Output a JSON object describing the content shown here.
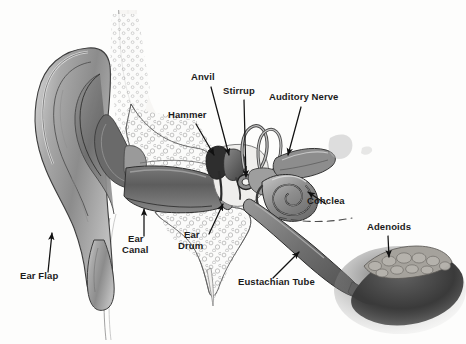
{
  "figure": {
    "background_color": "#fdfdfc",
    "label_color": "#1b1b1b",
    "ink_color": "#1a1a1a",
    "style": "grayscale medical illustration, cross-section"
  },
  "labels": {
    "ear_flap": "Ear Flap",
    "ear_canal_line1": "Ear",
    "ear_canal_line2": "Canal",
    "ear_drum_line1": "Ear",
    "ear_drum_line2": "Drum",
    "hammer": "Hammer",
    "anvil": "Anvil",
    "stirrup": "Stirrup",
    "auditory_nerve": "Auditory Nerve",
    "cochlea": "Cohclea",
    "eustachian_tube": "Eustachian Tube",
    "adenoids": "Adenoids"
  },
  "annotations": [
    {
      "id": "ear-flap",
      "label": "Ear Flap",
      "label_x": 25,
      "label_y": 276,
      "arrow_from": [
        48,
        272
      ],
      "arrow_to": [
        52,
        232
      ],
      "points_to": "pinna / auricle (outer ear)"
    },
    {
      "id": "ear-canal",
      "label": "Ear\nCanal",
      "label_x": 131,
      "label_y": 240,
      "arrow_from": [
        144,
        238
      ],
      "arrow_to": [
        144,
        208
      ],
      "points_to": "external auditory meatus"
    },
    {
      "id": "ear-drum",
      "label": "Ear\nDrum",
      "label_x": 185,
      "label_y": 236,
      "arrow_from": [
        211,
        236
      ],
      "arrow_to": [
        224,
        203
      ],
      "points_to": "tympanic membrane"
    },
    {
      "id": "hammer",
      "label": "Hammer",
      "label_x": 171,
      "label_y": 115,
      "arrow_from": [
        196,
        124
      ],
      "arrow_to": [
        216,
        157
      ],
      "points_to": "malleus"
    },
    {
      "id": "anvil",
      "label": "Anvil",
      "label_x": 192,
      "label_y": 77,
      "arrow_from": [
        211,
        88
      ],
      "arrow_to": [
        230,
        157
      ],
      "points_to": "incus"
    },
    {
      "id": "stirrup",
      "label": "Stirrup",
      "label_x": 226,
      "label_y": 91,
      "arrow_from": [
        244,
        100
      ],
      "arrow_to": [
        246,
        180
      ],
      "points_to": "stapes"
    },
    {
      "id": "auditory-nerve",
      "label": "Auditory Nerve",
      "label_x": 273,
      "label_y": 97,
      "arrow_from": [
        300,
        108
      ],
      "arrow_to": [
        288,
        156
      ],
      "points_to": "vestibulocochlear nerve"
    },
    {
      "id": "cochlea",
      "label": "Cohclea",
      "label_x": 310,
      "label_y": 200,
      "arrow_from": [
        325,
        203
      ],
      "arrow_to": [
        306,
        191
      ],
      "points_to": "cochlea spiral"
    },
    {
      "id": "eustachian-tube",
      "label": "Eustachian Tube",
      "label_x": 239,
      "label_y": 281,
      "arrow_from": [
        276,
        277
      ],
      "arrow_to": [
        300,
        252
      ],
      "points_to": "auditory tube to nasopharynx"
    },
    {
      "id": "adenoids",
      "label": "Adenoids",
      "label_x": 369,
      "label_y": 226,
      "arrow_from": [
        388,
        238
      ],
      "arrow_to": [
        389,
        256
      ],
      "points_to": "pharyngeal tonsil mass"
    }
  ],
  "structures": [
    "pinna",
    "ear canal",
    "ear drum",
    "hammer",
    "anvil",
    "stirrup",
    "semicircular canals",
    "cochlea",
    "auditory nerve",
    "eustachian tube",
    "adenoids",
    "temporal bone with mastoid air cells"
  ]
}
